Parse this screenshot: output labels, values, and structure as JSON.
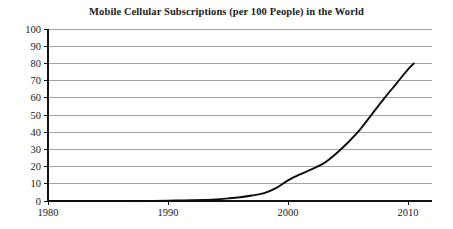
{
  "chart_data": {
    "type": "line",
    "title": "Mobile Cellular Subscriptions (per 100 People) in the World",
    "xlabel": "",
    "ylabel": "",
    "xlim": [
      1980,
      2012
    ],
    "ylim": [
      0,
      100
    ],
    "grid": true,
    "legend": "none",
    "x_ticks": [
      "1980",
      "1990",
      "2000",
      "2010"
    ],
    "x_tick_values": [
      1980,
      1990,
      2000,
      2010
    ],
    "y_ticks": [
      "0",
      "10",
      "20",
      "30",
      "40",
      "50",
      "60",
      "70",
      "80",
      "90",
      "100"
    ],
    "y_tick_values": [
      0,
      10,
      20,
      30,
      40,
      50,
      60,
      70,
      80,
      90,
      100
    ],
    "series": [
      {
        "name": "Mobile cellular subscriptions per 100 people",
        "x": [
          1980,
          1982,
          1984,
          1986,
          1988,
          1990,
          1991,
          1992,
          1993,
          1994,
          1995,
          1996,
          1997,
          1998,
          1999,
          2000,
          2001,
          2002,
          2003,
          2004,
          2005,
          2006,
          2007,
          2008,
          2009,
          2010,
          2010.5
        ],
        "values": [
          0,
          0,
          0,
          0.02,
          0.06,
          0.2,
          0.3,
          0.4,
          0.6,
          0.9,
          1.5,
          2.2,
          3.2,
          4.6,
          7.5,
          12.0,
          15.5,
          18.5,
          22.0,
          27.5,
          34.0,
          41.5,
          50.5,
          59.5,
          68.0,
          76.5,
          80.0
        ]
      }
    ]
  },
  "axes": {
    "plot_left_px": 48,
    "plot_right_px": 432,
    "plot_top_px": 29,
    "plot_bottom_px": 201
  }
}
